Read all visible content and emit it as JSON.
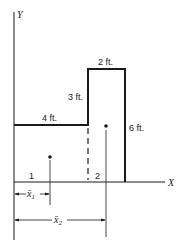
{
  "diagram": {
    "axes": {
      "y_label": "Y",
      "x_label": "X"
    },
    "dimensions": {
      "left_top_width": "4 ft.",
      "step_height": "3 ft.",
      "right_top_width": "2 ft.",
      "right_height": "6 ft."
    },
    "regions": [
      {
        "id": "1",
        "label": "1"
      },
      {
        "id": "2",
        "label": "2"
      }
    ],
    "centroid_distances": [
      {
        "label": "x̄1",
        "base": "x̄",
        "sub": "1"
      },
      {
        "label": "x̄2",
        "base": "x̄",
        "sub": "2"
      }
    ],
    "colors": {
      "line": "#1a1a1a",
      "background": "#ffffff"
    }
  }
}
